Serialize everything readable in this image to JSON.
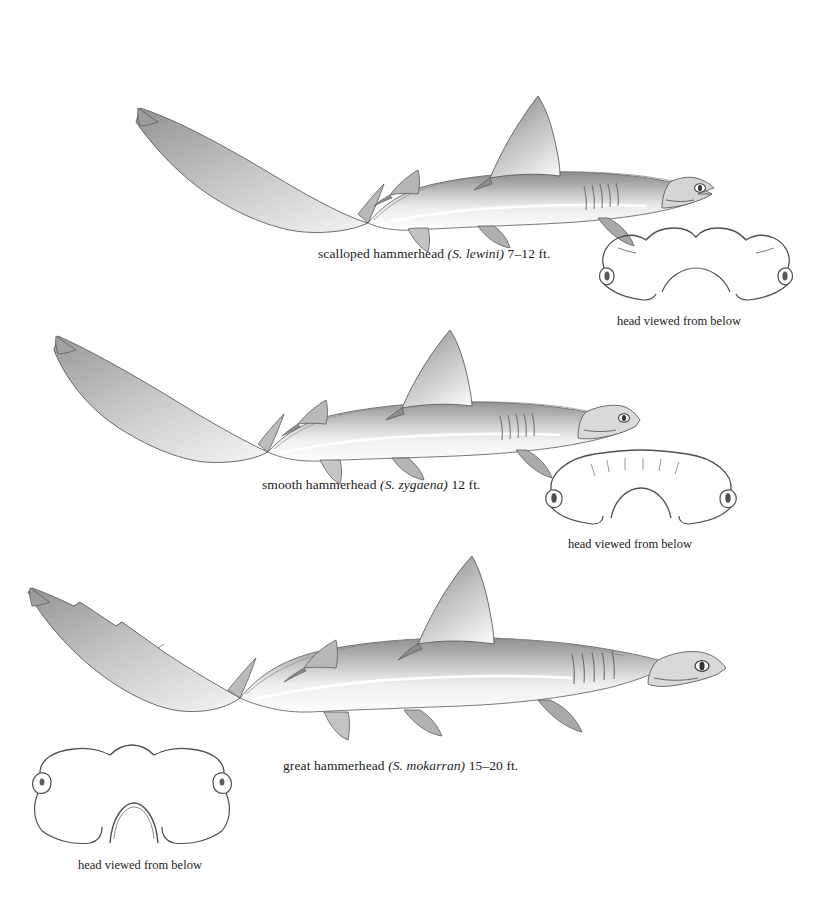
{
  "plate": {
    "title": "Hammerhead sharks",
    "background_color": "#ffffff",
    "ink_color": "#1b1b1b"
  },
  "figures": [
    {
      "id": "scalloped",
      "common_name": "scalloped hammerhead",
      "scientific_name": "(S. lewini)",
      "size": "7–12 ft.",
      "caption_full": "scalloped hammerhead (S. lewini) 7–12 ft.",
      "head_caption": "head viewed from below",
      "head_front_margin": "scalloped with median notch and two lateral indentations",
      "orientation": "facing right"
    },
    {
      "id": "smooth",
      "common_name": "smooth hammerhead",
      "scientific_name": "(S. zygaena)",
      "size": "12 ft.",
      "caption_full": "smooth hammerhead (S. zygaena) 12 ft.",
      "head_caption": "head viewed from below",
      "head_front_margin": "broadly arched, smooth, no median notch",
      "orientation": "facing right"
    },
    {
      "id": "great",
      "common_name": "great hammerhead",
      "scientific_name": "(S. mokarran)",
      "size": "15–20 ft.",
      "caption_full": "great hammerhead (S. mokarran) 15–20 ft.",
      "head_caption": "head viewed from below",
      "head_front_margin": "nearly straight with a deep median notch",
      "orientation": "facing right"
    }
  ],
  "labels": {
    "scalloped": {
      "common": "scalloped hammerhead ",
      "sci": "(S. lewini)",
      "size": " 7–12 ft."
    },
    "smooth": {
      "common": "smooth hammerhead ",
      "sci": "(S. zygaena)",
      "size": " 12 ft."
    },
    "great": {
      "common": "great hammerhead ",
      "sci": "(S. mokarran)",
      "size": " 15–20 ft."
    },
    "head_view": "head viewed from below"
  }
}
